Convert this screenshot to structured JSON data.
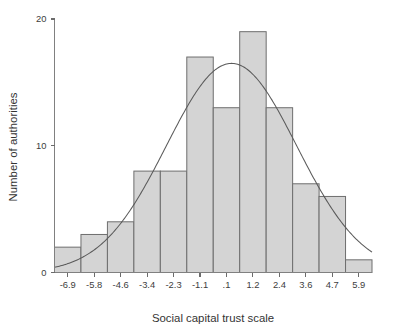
{
  "chart_data": {
    "type": "bar",
    "title": "",
    "subtitle": "",
    "xlabel": "Social capital trust scale",
    "ylabel": "Number of authorities",
    "categories": [
      "-6.9",
      "-5.8",
      "-4.6",
      "-3.4",
      "-2.3",
      "-1.1",
      ".1",
      "1.2",
      "2.4",
      "3.6",
      "4.7",
      "5.9"
    ],
    "values": [
      2,
      3,
      4,
      8,
      8,
      17,
      13,
      19,
      13,
      7,
      6,
      1
    ],
    "x": [
      -6.9,
      -5.8,
      -4.6,
      -3.4,
      -2.3,
      -1.1,
      0.1,
      1.2,
      2.4,
      3.6,
      4.7,
      5.9
    ],
    "xtick_labels": [
      "-6.9",
      "-5.8",
      "-4.6",
      "-3.4",
      "-2.3",
      "-1.1",
      ".1",
      "1.2",
      "2.4",
      "3.6",
      "4.7",
      "5.9"
    ],
    "ytick_labels": [
      "0",
      "10",
      "20"
    ],
    "ytick_values": [
      0,
      10,
      20
    ],
    "ylim": [
      0,
      20
    ],
    "xlim": [
      -7.45,
      6.45
    ],
    "grid": false,
    "legend": null,
    "overlay": {
      "name": "normal curve",
      "type": "line",
      "mean": 0.3,
      "stddev": 2.85,
      "peak_value": 16.5
    },
    "bar_fill_color": "#d4d4d4",
    "bar_edge_color": "#6e6e6e",
    "curve_color": "#5a5a5a",
    "axis_color": "#808080",
    "text_color": "#3d3d3d",
    "background_color": "#ffffff"
  }
}
